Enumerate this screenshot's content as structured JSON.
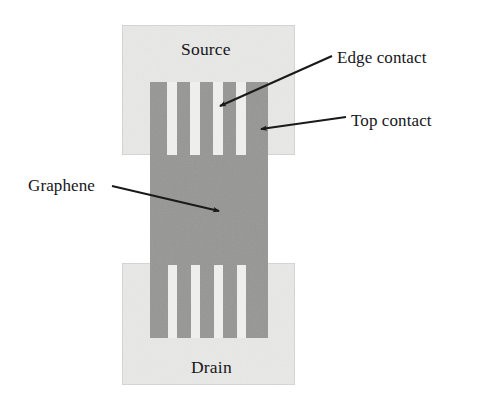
{
  "figure": {
    "background_color": "#ffffff",
    "width": 488,
    "height": 409
  },
  "colors": {
    "pad_fill": "#e8e8e6",
    "pad_stroke": "#c9c9c6",
    "graphene_fill": "#969694",
    "finger_fill": "#969694",
    "gap_fill": "#eeeeec",
    "arrow": "#1a1a1a",
    "text": "#16161a"
  },
  "labels": {
    "source": "Source",
    "drain": "Drain",
    "graphene": "Graphene",
    "edge_contact": "Edge contact",
    "top_contact": "Top contact"
  },
  "shapes": {
    "source_pad": {
      "x": 122,
      "y": 25,
      "width": 173,
      "height": 130
    },
    "drain_pad": {
      "x": 122,
      "y": 263,
      "width": 173,
      "height": 122
    },
    "graphene_channel": {
      "x": 150,
      "y": 82,
      "width": 118,
      "height": 256
    },
    "source_finger_gaps": [
      {
        "x": 167,
        "y": 82,
        "width": 10,
        "height": 73
      },
      {
        "x": 190,
        "y": 82,
        "width": 10,
        "height": 73
      },
      {
        "x": 213,
        "y": 82,
        "width": 10,
        "height": 73
      },
      {
        "x": 236,
        "y": 82,
        "width": 10,
        "height": 73
      }
    ],
    "drain_finger_gaps": [
      {
        "x": 168,
        "y": 265,
        "width": 9,
        "height": 73
      },
      {
        "x": 191,
        "y": 265,
        "width": 9,
        "height": 73
      },
      {
        "x": 214,
        "y": 265,
        "width": 9,
        "height": 73
      },
      {
        "x": 237,
        "y": 265,
        "width": 9,
        "height": 73
      }
    ],
    "finger_count": 5
  },
  "arrows": {
    "edge_contact": {
      "x1": 332,
      "y1": 56,
      "x2": 220,
      "y2": 106
    },
    "top_contact": {
      "x1": 346,
      "y1": 117,
      "x2": 261,
      "y2": 129
    },
    "graphene": {
      "x1": 112,
      "y1": 186,
      "x2": 219,
      "y2": 211
    }
  }
}
